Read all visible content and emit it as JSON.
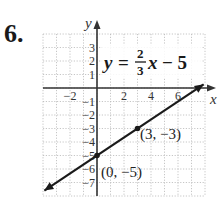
{
  "problem_number": "6.",
  "chart_data": {
    "type": "line",
    "equation": {
      "lhs": "y",
      "equals": "=",
      "numerator": "2",
      "denominator": "3",
      "variable": "x",
      "rest": "− 5"
    },
    "xlabel": "x",
    "ylabel": "y",
    "xlim": [
      -4,
      8
    ],
    "ylim": [
      -8,
      4
    ],
    "grid": true,
    "x_ticks": [
      {
        "value": -2,
        "label": "−2"
      },
      {
        "value": 2,
        "label": "2"
      },
      {
        "value": 4,
        "label": "4"
      },
      {
        "value": 6,
        "label": "6"
      }
    ],
    "y_ticks": [
      {
        "value": 3,
        "label": "3"
      },
      {
        "value": 2,
        "label": "2"
      },
      {
        "value": 1,
        "label": "1"
      },
      {
        "value": -1,
        "label": "−1"
      },
      {
        "value": -2,
        "label": "−2"
      },
      {
        "value": -3,
        "label": "−3"
      },
      {
        "value": -4,
        "label": "−4"
      },
      {
        "value": -5,
        "label": "−5"
      },
      {
        "value": -6,
        "label": "−6"
      },
      {
        "value": -7,
        "label": "−7"
      }
    ],
    "series": [
      {
        "name": "y = (2/3)x - 5",
        "slope": 0.6667,
        "intercept": -5,
        "x": [
          -3.9,
          0,
          3,
          7.9
        ],
        "y": [
          -7.6,
          -5,
          -3,
          0.27
        ],
        "arrows": "both"
      }
    ],
    "points": [
      {
        "x": 0,
        "y": -5,
        "label": "(0, −5)"
      },
      {
        "x": 3,
        "y": -3,
        "label": "(3, −3)"
      }
    ],
    "colors": {
      "line": "#1a1a1a",
      "axis": "#333333",
      "grid": "#b8b8b8"
    }
  }
}
